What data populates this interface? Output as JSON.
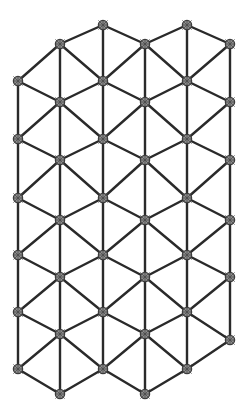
{
  "figure": {
    "name": "triangular-lattice",
    "background_color": "#ffffff",
    "edge_color": "#2a2a2a",
    "edge_width": 2.4,
    "node_fill_color": "#8e8e8e",
    "node_stroke_color": "#3a3a3a",
    "node_radius": 4.6,
    "width": 247,
    "height": 414
  },
  "chart_data": {
    "type": "scatter",
    "xlabel": "",
    "ylabel": "",
    "grid": false,
    "legend": null,
    "xlim": [
      0,
      247
    ],
    "ylim": [
      0,
      414
    ],
    "node_count": 47,
    "edge_count": 116,
    "columns": [
      18,
      60,
      103,
      145,
      187,
      230
    ],
    "column_node_counts": [
      6,
      7,
      7,
      7,
      7,
      6
    ],
    "row_spacing": 58.5,
    "nodes": [
      {
        "id": 0,
        "col": 0,
        "x": 18,
        "y": 81
      },
      {
        "id": 1,
        "col": 0,
        "x": 18,
        "y": 139
      },
      {
        "id": 2,
        "col": 0,
        "x": 18,
        "y": 198
      },
      {
        "id": 3,
        "col": 0,
        "x": 18,
        "y": 255
      },
      {
        "id": 4,
        "col": 0,
        "x": 18,
        "y": 312
      },
      {
        "id": 5,
        "col": 0,
        "x": 18,
        "y": 369
      },
      {
        "id": 6,
        "col": 1,
        "x": 60,
        "y": 44
      },
      {
        "id": 7,
        "col": 1,
        "x": 60,
        "y": 102
      },
      {
        "id": 8,
        "col": 1,
        "x": 60,
        "y": 160
      },
      {
        "id": 9,
        "col": 1,
        "x": 60,
        "y": 220
      },
      {
        "id": 10,
        "col": 1,
        "x": 60,
        "y": 277
      },
      {
        "id": 11,
        "col": 1,
        "x": 60,
        "y": 334
      },
      {
        "id": 12,
        "col": 1,
        "x": 60,
        "y": 394
      },
      {
        "id": 13,
        "col": 2,
        "x": 103,
        "y": 25
      },
      {
        "id": 14,
        "col": 2,
        "x": 103,
        "y": 81
      },
      {
        "id": 15,
        "col": 2,
        "x": 103,
        "y": 139
      },
      {
        "id": 16,
        "col": 2,
        "x": 103,
        "y": 198
      },
      {
        "id": 17,
        "col": 2,
        "x": 103,
        "y": 255
      },
      {
        "id": 18,
        "col": 2,
        "x": 103,
        "y": 312
      },
      {
        "id": 19,
        "col": 2,
        "x": 103,
        "y": 369
      },
      {
        "id": 20,
        "col": 3,
        "x": 145,
        "y": 44
      },
      {
        "id": 21,
        "col": 3,
        "x": 145,
        "y": 102
      },
      {
        "id": 22,
        "col": 3,
        "x": 145,
        "y": 160
      },
      {
        "id": 23,
        "col": 3,
        "x": 145,
        "y": 220
      },
      {
        "id": 24,
        "col": 3,
        "x": 145,
        "y": 277
      },
      {
        "id": 25,
        "col": 3,
        "x": 145,
        "y": 334
      },
      {
        "id": 26,
        "col": 3,
        "x": 145,
        "y": 394
      },
      {
        "id": 27,
        "col": 4,
        "x": 187,
        "y": 25
      },
      {
        "id": 28,
        "col": 4,
        "x": 187,
        "y": 81
      },
      {
        "id": 29,
        "col": 4,
        "x": 187,
        "y": 139
      },
      {
        "id": 30,
        "col": 4,
        "x": 187,
        "y": 198
      },
      {
        "id": 31,
        "col": 4,
        "x": 187,
        "y": 255
      },
      {
        "id": 32,
        "col": 4,
        "x": 187,
        "y": 312
      },
      {
        "id": 33,
        "col": 4,
        "x": 187,
        "y": 369
      },
      {
        "id": 34,
        "col": 5,
        "x": 230,
        "y": 44
      },
      {
        "id": 35,
        "col": 5,
        "x": 230,
        "y": 102
      },
      {
        "id": 36,
        "col": 5,
        "x": 230,
        "y": 160
      },
      {
        "id": 37,
        "col": 5,
        "x": 230,
        "y": 220
      },
      {
        "id": 38,
        "col": 5,
        "x": 230,
        "y": 277
      },
      {
        "id": 39,
        "col": 5,
        "x": 230,
        "y": 340
      }
    ],
    "edges": [
      [
        0,
        1
      ],
      [
        1,
        2
      ],
      [
        2,
        3
      ],
      [
        3,
        4
      ],
      [
        4,
        5
      ],
      [
        6,
        7
      ],
      [
        7,
        8
      ],
      [
        8,
        9
      ],
      [
        9,
        10
      ],
      [
        10,
        11
      ],
      [
        11,
        12
      ],
      [
        13,
        14
      ],
      [
        14,
        15
      ],
      [
        15,
        16
      ],
      [
        16,
        17
      ],
      [
        17,
        18
      ],
      [
        18,
        19
      ],
      [
        20,
        21
      ],
      [
        21,
        22
      ],
      [
        22,
        23
      ],
      [
        23,
        24
      ],
      [
        24,
        25
      ],
      [
        25,
        26
      ],
      [
        27,
        28
      ],
      [
        28,
        29
      ],
      [
        29,
        30
      ],
      [
        30,
        31
      ],
      [
        31,
        32
      ],
      [
        32,
        33
      ],
      [
        34,
        35
      ],
      [
        35,
        36
      ],
      [
        36,
        37
      ],
      [
        37,
        38
      ],
      [
        38,
        39
      ],
      [
        0,
        6
      ],
      [
        0,
        7
      ],
      [
        1,
        7
      ],
      [
        1,
        8
      ],
      [
        2,
        8
      ],
      [
        2,
        9
      ],
      [
        3,
        9
      ],
      [
        3,
        10
      ],
      [
        4,
        10
      ],
      [
        4,
        11
      ],
      [
        5,
        11
      ],
      [
        5,
        12
      ],
      [
        6,
        13
      ],
      [
        6,
        14
      ],
      [
        7,
        14
      ],
      [
        7,
        15
      ],
      [
        8,
        15
      ],
      [
        8,
        16
      ],
      [
        9,
        16
      ],
      [
        9,
        17
      ],
      [
        10,
        17
      ],
      [
        10,
        18
      ],
      [
        11,
        18
      ],
      [
        11,
        19
      ],
      [
        12,
        19
      ],
      [
        13,
        20
      ],
      [
        14,
        20
      ],
      [
        14,
        21
      ],
      [
        15,
        21
      ],
      [
        15,
        22
      ],
      [
        16,
        22
      ],
      [
        16,
        23
      ],
      [
        17,
        23
      ],
      [
        17,
        24
      ],
      [
        18,
        24
      ],
      [
        18,
        25
      ],
      [
        19,
        25
      ],
      [
        19,
        26
      ],
      [
        20,
        27
      ],
      [
        20,
        28
      ],
      [
        21,
        28
      ],
      [
        21,
        29
      ],
      [
        22,
        29
      ],
      [
        22,
        30
      ],
      [
        23,
        30
      ],
      [
        23,
        31
      ],
      [
        24,
        31
      ],
      [
        24,
        32
      ],
      [
        25,
        32
      ],
      [
        25,
        33
      ],
      [
        26,
        33
      ],
      [
        27,
        34
      ],
      [
        28,
        34
      ],
      [
        28,
        35
      ],
      [
        29,
        35
      ],
      [
        29,
        36
      ],
      [
        30,
        36
      ],
      [
        30,
        37
      ],
      [
        31,
        37
      ],
      [
        31,
        38
      ],
      [
        32,
        38
      ],
      [
        32,
        39
      ],
      [
        33,
        39
      ]
    ]
  }
}
